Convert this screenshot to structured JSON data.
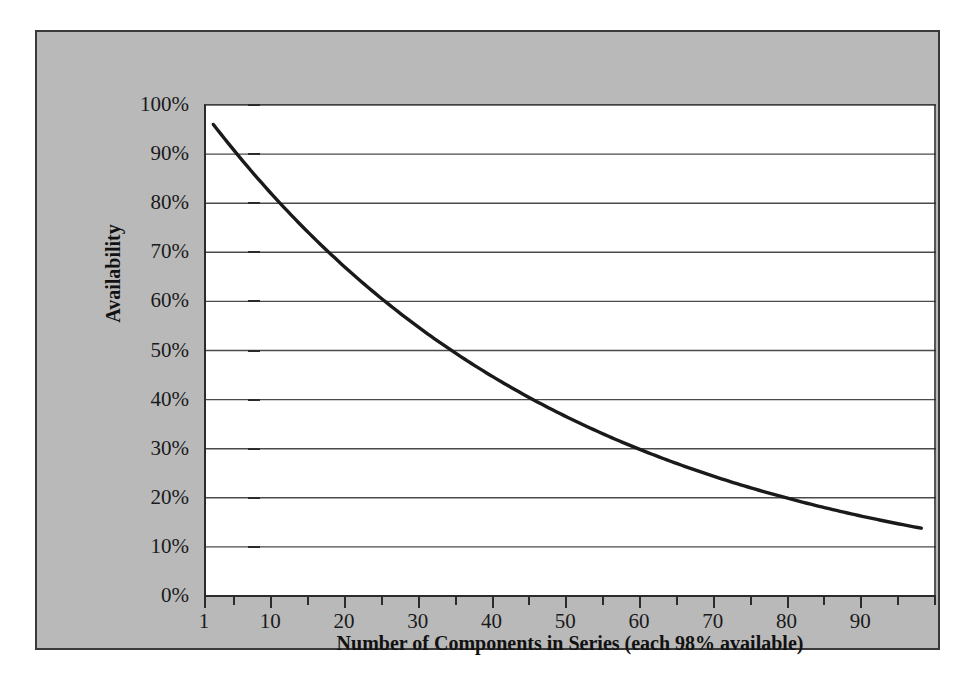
{
  "chart_data": {
    "type": "line",
    "title": "",
    "xlabel": "Number of Components in Series (each 98% available)",
    "ylabel": "Availability",
    "xlim": [
      1,
      100
    ],
    "ylim": [
      0,
      1
    ],
    "grid": true,
    "legend": false,
    "series_formula": "0.98^n",
    "x_tick_labels": [
      "1",
      "10",
      "20",
      "30",
      "40",
      "50",
      "60",
      "70",
      "80",
      "90"
    ],
    "x_tick_values": [
      1,
      10,
      20,
      30,
      40,
      50,
      60,
      70,
      80,
      90
    ],
    "x_minor_tick_values": [
      5,
      15,
      25,
      35,
      45,
      55,
      65,
      75,
      85,
      95,
      100
    ],
    "y_tick_labels": [
      "0%",
      "10%",
      "20%",
      "30%",
      "40%",
      "50%",
      "60%",
      "70%",
      "80%",
      "90%",
      "100%"
    ],
    "y_tick_values": [
      0,
      0.1,
      0.2,
      0.3,
      0.4,
      0.5,
      0.6,
      0.7,
      0.8,
      0.9,
      1.0
    ],
    "series": [
      {
        "name": "Availability",
        "x": [
          2,
          5,
          10,
          15,
          20,
          25,
          30,
          35,
          40,
          45,
          50,
          55,
          60,
          65,
          70,
          75,
          80,
          85,
          90,
          95,
          98
        ],
        "values": [
          0.9604,
          0.9039,
          0.8171,
          0.7386,
          0.6676,
          0.6035,
          0.5455,
          0.4931,
          0.4457,
          0.4029,
          0.3642,
          0.3292,
          0.2976,
          0.269,
          0.2431,
          0.2198,
          0.1987,
          0.1796,
          0.1623,
          0.1467,
          0.1381
        ]
      }
    ]
  },
  "axis": {
    "x_title": "Number of Components in Series (each 98% available)",
    "y_title": "Availability"
  },
  "colors": {
    "panel_background": "#b9b9b9",
    "plot_background": "#ffffff",
    "line": "#1a1a1a",
    "grid": "#4a4a4a",
    "border": "#3a3a3a"
  }
}
